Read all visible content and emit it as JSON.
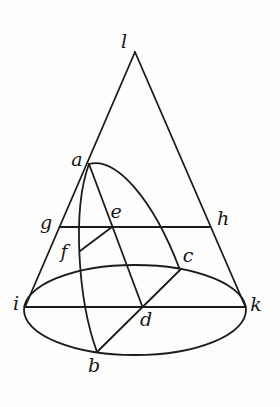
{
  "figure": {
    "background_color": "#fdfdfc",
    "stroke_color": "#1c1c1c",
    "label_color": "#161616",
    "stroke_width": 1.8,
    "labels": [
      {
        "text": "l",
        "x": 124,
        "y": 41
      },
      {
        "text": "a",
        "x": 77,
        "y": 159
      },
      {
        "text": "g",
        "x": 46,
        "y": 222
      },
      {
        "text": "e",
        "x": 116,
        "y": 211
      },
      {
        "text": "h",
        "x": 223,
        "y": 218
      },
      {
        "text": "f",
        "x": 64,
        "y": 251
      },
      {
        "text": "c",
        "x": 188,
        "y": 255
      },
      {
        "text": "i",
        "x": 16,
        "y": 303
      },
      {
        "text": "k",
        "x": 256,
        "y": 304
      },
      {
        "text": "d",
        "x": 146,
        "y": 319
      },
      {
        "text": "b",
        "x": 94,
        "y": 365
      }
    ],
    "geometry": {
      "base_ellipse": {
        "name": "base-circle-ellipse",
        "cx": 135,
        "cy": 310,
        "rx": 111,
        "ry": 45
      },
      "lines": [
        {
          "name": "cone-left-slant-l-i",
          "x1": 135,
          "y1": 52,
          "x2": 25,
          "y2": 307
        },
        {
          "name": "cone-right-slant-l-k",
          "x1": 135,
          "y1": 52,
          "x2": 245.5,
          "y2": 307
        },
        {
          "name": "base-diameter-i-k",
          "x1": 25,
          "y1": 307,
          "x2": 245.5,
          "y2": 307
        },
        {
          "name": "parallel-chord-g-h",
          "x1": 59.5,
          "y1": 227,
          "x2": 210.5,
          "y2": 227
        },
        {
          "name": "section-diameter-a-d",
          "x1": 89,
          "y1": 164,
          "x2": 142.5,
          "y2": 307
        },
        {
          "name": "base-chord-c-b",
          "x1": 180,
          "y1": 270,
          "x2": 97,
          "y2": 352
        },
        {
          "name": "ordinate-e-f",
          "x1": 112,
          "y1": 227,
          "x2": 80,
          "y2": 251
        }
      ],
      "curves": [
        {
          "name": "section-curve-front-a-c",
          "d": "M 89 164 C 115 157 152 196 180 270"
        },
        {
          "name": "section-curve-back-a-f-b",
          "d": "M 89 164 C 72 210 78 300 97 352"
        }
      ]
    }
  }
}
